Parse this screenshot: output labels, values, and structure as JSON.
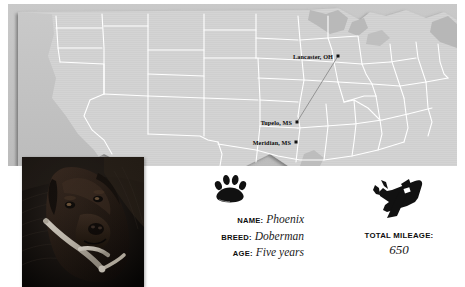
{
  "map": {
    "region_name": "United States",
    "land_color": "#d2d2d2",
    "border_color": "#ffffff",
    "water_color": "#bdbdbd",
    "route_color": "#8a8a8a",
    "cities": [
      {
        "label": "Lancaster, OH",
        "x": 330,
        "y": 52,
        "dot": true
      },
      {
        "label": "Tupelo, MS",
        "x": 289,
        "y": 118,
        "dot": true
      },
      {
        "label": "Meridian, MS",
        "x": 288,
        "y": 138,
        "dot": true
      }
    ],
    "route": {
      "from": "Lancaster, OH",
      "to": "Tupelo, MS"
    }
  },
  "photo": {
    "alt": "Phoenix the Doberman dog portrait",
    "subject": "dog"
  },
  "pet": {
    "paw_icon": "paw-print-icon",
    "fields": [
      {
        "label": "NAME:",
        "value": "Phoenix"
      },
      {
        "label": "BREED:",
        "value": "Doberman"
      },
      {
        "label": "AGE:",
        "value": "Five years"
      }
    ]
  },
  "mileage": {
    "plane_icon": "airplane-icon",
    "label": "TOTAL MILEAGE:",
    "value": "650"
  }
}
